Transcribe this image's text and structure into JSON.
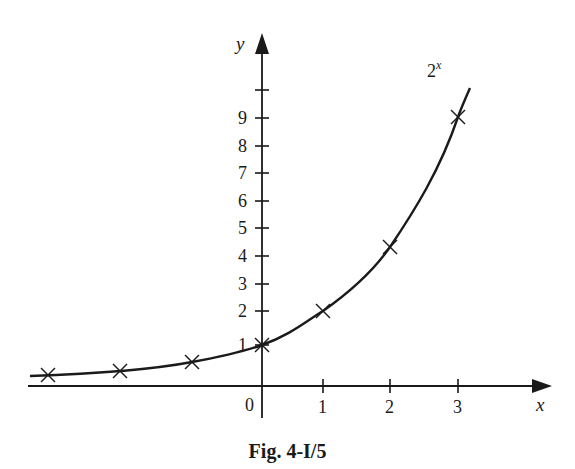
{
  "figure": {
    "caption": "Fig. 4-I/5",
    "curve_label_base": "2",
    "curve_label_exp": "x"
  },
  "axes": {
    "x_label": "x",
    "y_label": "y",
    "origin_label": "0",
    "x_ticks": [
      {
        "label": "1",
        "px": 323
      },
      {
        "label": "2",
        "px": 390
      },
      {
        "label": "3",
        "px": 458
      }
    ],
    "y_ticks": [
      {
        "label": "1",
        "py": 345
      },
      {
        "label": "2",
        "py": 311
      },
      {
        "label": "3",
        "py": 284
      },
      {
        "label": "4",
        "py": 256
      },
      {
        "label": "5",
        "py": 228
      },
      {
        "label": "6",
        "py": 201
      },
      {
        "label": "7",
        "py": 173
      },
      {
        "label": "8",
        "py": 146
      },
      {
        "label": "9",
        "py": 118
      },
      {
        "label": "",
        "py": 90
      }
    ]
  },
  "markers_px": [
    {
      "x": 48,
      "y": 375
    },
    {
      "x": 120,
      "y": 371
    },
    {
      "x": 192,
      "y": 362
    },
    {
      "x": 262,
      "y": 345
    },
    {
      "x": 323,
      "y": 311
    },
    {
      "x": 390,
      "y": 247
    },
    {
      "x": 458,
      "y": 117
    }
  ],
  "colors": {
    "ink": "#1a1a1a",
    "background": "#ffffff"
  },
  "chart_data": {
    "type": "line",
    "title": "Fig. 4-I/5",
    "xlabel": "x",
    "ylabel": "y",
    "series": [
      {
        "name": "2^x",
        "x": [
          -3,
          -2,
          -1,
          0,
          1,
          2,
          3
        ],
        "values": [
          0.125,
          0.25,
          0.5,
          1,
          2,
          4,
          8
        ],
        "marker": "x"
      }
    ],
    "x_ticks": [
      0,
      1,
      2,
      3
    ],
    "y_ticks": [
      1,
      2,
      3,
      4,
      5,
      6,
      7,
      8,
      9
    ],
    "xlim": [
      -3.3,
      4.3
    ],
    "ylim": [
      -0.3,
      11
    ],
    "grid": false,
    "legend": "none",
    "annotations": [
      "2^x"
    ]
  }
}
